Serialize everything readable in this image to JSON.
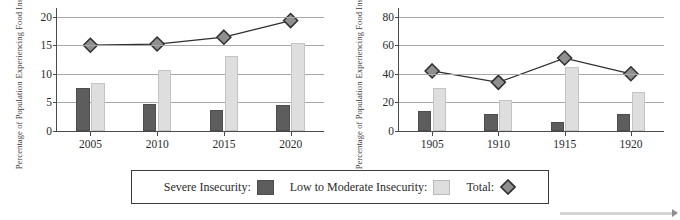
{
  "legend": {
    "severe_label": "Severe Insecurity:",
    "lowmod_label": "Low to Moderate Insecurity:",
    "total_label": "Total:",
    "severe_swatch_icon": "dark-square-swatch",
    "lowmod_swatch_icon": "light-square-swatch",
    "total_marker_icon": "diamond-marker"
  },
  "scroll_hint": {
    "arrow_icon": "right-arrow-icon"
  },
  "colors": {
    "severe": "#5d5d5d",
    "low_to_moderate": "#dedede",
    "total_marker_fill": "#8f8f8f",
    "total_marker_stroke": "#2f2f2f",
    "line": "#2f2f2f",
    "gridline": "#a8a8a8",
    "axis": "#4a4a4a"
  },
  "chart_data": [
    {
      "type": "bar",
      "id": "left-chart",
      "title": "",
      "xlabel": "",
      "ylabel": "Percentage of Population Experiencing Food Insecurity",
      "ylabel_line1": "Percentage of Population",
      "ylabel_line2": "Experiencing Food Insecurity",
      "categories": [
        "2005",
        "2010",
        "2015",
        "2020"
      ],
      "ylim": [
        0,
        21.5
      ],
      "yticks": [
        0,
        5,
        10,
        15,
        20
      ],
      "ytick_labels": [
        "0",
        "5",
        "10",
        "15",
        "20"
      ],
      "grid": true,
      "legend_position": "bottom-shared",
      "series": [
        {
          "name": "Severe Insecurity",
          "type": "bar",
          "values": [
            7.5,
            4.8,
            3.7,
            4.5
          ]
        },
        {
          "name": "Low to Moderate Insecurity",
          "type": "bar",
          "values": [
            8.4,
            10.6,
            13.1,
            15.3
          ]
        },
        {
          "name": "Total",
          "type": "line",
          "values": [
            15.0,
            15.2,
            16.4,
            19.3
          ]
        }
      ]
    },
    {
      "type": "bar",
      "id": "right-chart",
      "title": "",
      "xlabel": "",
      "ylabel": "Percentage of Population Experiencing Food Insecurity",
      "ylabel_line1": "Percentage of Population",
      "ylabel_line2": "Experiencing Food Insecurity",
      "categories": [
        "1905",
        "1910",
        "1915",
        "1920"
      ],
      "ylim": [
        0,
        86
      ],
      "yticks": [
        0,
        20,
        40,
        60,
        80
      ],
      "ytick_labels": [
        "0",
        "20",
        "40",
        "60",
        "80"
      ],
      "grid": true,
      "legend_position": "bottom-shared",
      "series": [
        {
          "name": "Severe Insecurity",
          "type": "bar",
          "values": [
            14,
            12,
            6,
            12
          ]
        },
        {
          "name": "Low to Moderate Insecurity",
          "type": "bar",
          "values": [
            30,
            22,
            45,
            27
          ]
        },
        {
          "name": "Total",
          "type": "line",
          "values": [
            42,
            34,
            51,
            40
          ]
        }
      ]
    }
  ]
}
